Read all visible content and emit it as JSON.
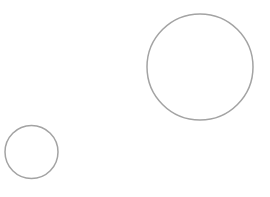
{
  "canvas": {
    "width": 270,
    "height": 197,
    "background_color": "#ffffff",
    "title": "Two circle outlines"
  },
  "style": {
    "stroke_color": "#a3a3a3",
    "stroke_width": 1.5,
    "fill": "none"
  },
  "shapes": [
    {
      "name": "large-circle",
      "type": "circle",
      "cx": 200,
      "cy": 67,
      "r": 53,
      "stroke_color": "#a3a3a3",
      "stroke_width": 1.5,
      "fill": "none"
    },
    {
      "name": "small-circle",
      "type": "circle",
      "cx": 31.5,
      "cy": 152,
      "r": 26.5,
      "stroke_color": "#a3a3a3",
      "stroke_width": 1.5,
      "fill": "none"
    }
  ]
}
